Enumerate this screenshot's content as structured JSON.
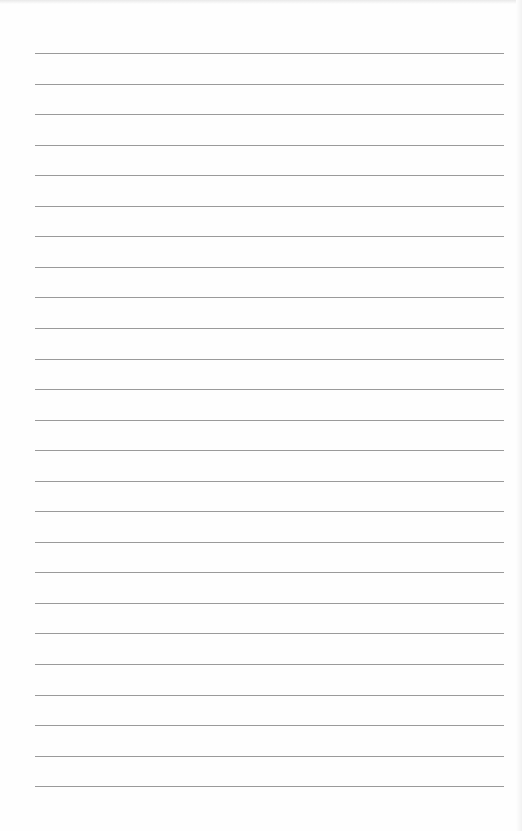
{
  "page": {
    "type": "lined-paper",
    "background_color": "#fefefe",
    "line_color": "#9a9a9a",
    "line_count": 25,
    "first_line_y": 53,
    "line_spacing": 30.55,
    "line_left": 35,
    "line_width": 469
  }
}
